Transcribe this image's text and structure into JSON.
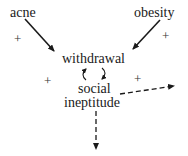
{
  "diagram": {
    "nodes": [
      {
        "id": "acne",
        "label": "acne"
      },
      {
        "id": "obesity",
        "label": "obesity"
      },
      {
        "id": "withdrawal",
        "label": "withdrawal"
      },
      {
        "id": "social_ineptitude",
        "label_line1": "social",
        "label_line2": "ineptitude"
      }
    ],
    "edges": [
      {
        "from": "acne",
        "to": "withdrawal",
        "style": "solid",
        "sign": "+"
      },
      {
        "from": "obesity",
        "to": "withdrawal",
        "style": "solid",
        "sign": "+"
      },
      {
        "from": "withdrawal",
        "to": "social_ineptitude",
        "style": "curved",
        "sign": "+"
      },
      {
        "from": "social_ineptitude",
        "to": "withdrawal",
        "style": "curved",
        "sign": "+"
      },
      {
        "from": "social_ineptitude",
        "to": "outside-right",
        "style": "dashed"
      },
      {
        "from": "social_ineptitude",
        "to": "outside-down",
        "style": "dashed"
      }
    ],
    "signs": {
      "acne_sign": "+",
      "obesity_sign": "+",
      "left_loop_sign": "+",
      "right_loop_sign": "+"
    },
    "colors": {
      "ink": "#1a1a1a",
      "background": "#ffffff"
    }
  }
}
